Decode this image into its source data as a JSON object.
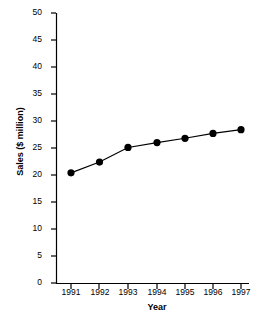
{
  "chart_data": {
    "type": "line",
    "title": "",
    "subtitle": "",
    "xlabel": "Year",
    "ylabel": "Sales ($ million)",
    "categories": [
      "1991",
      "1992",
      "1993",
      "1994",
      "1995",
      "1996",
      "1997"
    ],
    "x": [
      1991,
      1992,
      1993,
      1994,
      1995,
      1996,
      1997
    ],
    "values": [
      20.4,
      22.4,
      25.1,
      26.0,
      26.8,
      27.7,
      28.4
    ],
    "series": [
      {
        "name": "Sales",
        "values": [
          20.4,
          22.4,
          25.1,
          26.0,
          26.8,
          27.7,
          28.4
        ],
        "color": "#000000",
        "marker": "filled-circle",
        "line_style": "solid"
      }
    ],
    "ylim": [
      0,
      50
    ],
    "yticks": [
      0,
      5,
      10,
      15,
      20,
      25,
      30,
      35,
      40,
      45,
      50
    ],
    "ytick_labels": [
      "0",
      "5",
      "10",
      "15",
      "20",
      "25",
      "30",
      "35",
      "40",
      "45",
      "50"
    ],
    "xtick_labels": [
      "1991",
      "1992",
      "1993",
      "1994",
      "1995",
      "1996",
      "1997"
    ],
    "grid": false,
    "legend": false,
    "legend_position": "none",
    "annotations": [],
    "axis_color": "#000000",
    "background_color": "#ffffff"
  }
}
